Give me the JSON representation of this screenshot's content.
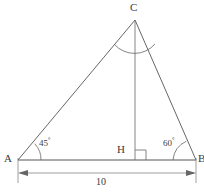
{
  "figure": {
    "type": "geometry-diagram",
    "shape": "triangle",
    "stroke_color": "#555555",
    "background_color": "#ffffff",
    "vertices": [
      {
        "name": "A",
        "label": "A",
        "x": 18,
        "y": 160,
        "label_x": 4,
        "label_y": 155
      },
      {
        "name": "B",
        "label": "B",
        "x": 196,
        "y": 160,
        "label_x": 199,
        "label_y": 155
      },
      {
        "name": "C",
        "label": "C",
        "x": 135,
        "y": 20,
        "label_x": 131,
        "label_y": 2
      }
    ],
    "foot": {
      "name": "H",
      "label": "H",
      "x": 135,
      "y": 160,
      "label_x": 118,
      "label_y": 145
    },
    "altitude": {
      "from": "C",
      "to": "H",
      "perpendicular": true
    },
    "angles": [
      {
        "at": "A",
        "value": "45",
        "unit": "°",
        "label_x": 38,
        "label_y": 138
      },
      {
        "at": "B",
        "value": "60",
        "unit": "°",
        "label_x": 163,
        "label_y": 138
      }
    ],
    "apex_arc": {
      "at": "C",
      "radius": 26,
      "label": ""
    },
    "dimension": {
      "label": "10",
      "from": "A",
      "to": "B",
      "line_y": 173,
      "label_x": 95,
      "label_y": 178,
      "arrows": "both"
    }
  }
}
